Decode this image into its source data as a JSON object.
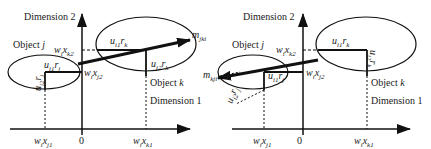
{
  "panels": [
    {
      "id": "left",
      "axis_x_label": "Dimension 1",
      "axis_y_label": "Dimension 2",
      "origin_label": "0",
      "object_j_label": "Object j",
      "object_k_label": "Object k",
      "arrow_label": "m_jki",
      "arrow_label_base": "m",
      "arrow_label_sub": "jki",
      "tick_xj1": "w_i x_j1",
      "tick_xk1": "w_i x_k1",
      "tick_xk2": "w_i x_k2",
      "tick_xj2": "w_i x_j2",
      "u1rk": "u_i1 r_k",
      "u2rk": "u_i2 r_k",
      "u1rj": "u_i1 r_j",
      "u2rj": "u_i2 r_j"
    },
    {
      "id": "right",
      "axis_x_label": "Dimension 1",
      "axis_y_label": "Dimension 2",
      "origin_label": "0",
      "object_j_label": "Object j",
      "object_k_label": "Object k",
      "arrow_label": "m_kji",
      "arrow_label_base": "m",
      "arrow_label_sub": "kji",
      "tick_xj1": "w_i x_j1",
      "tick_xk1": "w_i x_k1",
      "tick_xk2": "w_i x_k2",
      "tick_xj2": "w_i x_j2",
      "u1rk": "u_i1 r_k",
      "u2rk": "u_i2 r_k",
      "u1rj": "u_i1 r_j",
      "u2rj": "u_i2 r_j"
    }
  ],
  "text": {
    "dim1": "Dimension 1",
    "dim2": "Dimension 2",
    "obj_j": "Object ",
    "obj_j_var": "j",
    "obj_k": "Object ",
    "obj_k_var": "k",
    "zero": "0",
    "w": "w",
    "i": "i",
    "x": "x",
    "j1": "j1",
    "j2": "j2",
    "k1": "k1",
    "k2": "k2",
    "u": "u",
    "i1": "i1",
    "i2": "i2",
    "r": "r",
    "k": "k",
    "j": "j",
    "m": "m",
    "jki": "jki",
    "kji": "kji"
  }
}
